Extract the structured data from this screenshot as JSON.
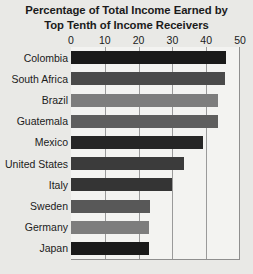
{
  "chart_data": {
    "type": "bar",
    "orientation": "horizontal",
    "title": "Percentage of Total Income Earned by Top Tenth of Income Receivers",
    "title_line1": "Percentage of Total Income Earned by",
    "title_line2": "Top Tenth of Income Receivers",
    "xlabel": "",
    "ylabel": "",
    "xlim": [
      0,
      50
    ],
    "xticks": [
      0,
      10,
      20,
      30,
      40,
      50
    ],
    "xtick_labels": [
      "0",
      "10",
      "20",
      "30",
      "40",
      "50"
    ],
    "grid": "vertical",
    "legend": "none",
    "categories": [
      "Colombia",
      "South Africa",
      "Brazil",
      "Guatemala",
      "Mexico",
      "United States",
      "Italy",
      "Sweden",
      "Germany",
      "Japan"
    ],
    "values": [
      46,
      45.5,
      43.5,
      43.5,
      39,
      33.5,
      30,
      23.5,
      23,
      23
    ],
    "bar_colors": [
      "#1a1a1a",
      "#4a4a4a",
      "#7d7d7d",
      "#5e5e5e",
      "#262626",
      "#3b3b3b",
      "#343434",
      "#585858",
      "#7d7d7d",
      "#1a1a1a"
    ],
    "series": [
      {
        "name": "Percentage of total income",
        "values": [
          46,
          45.5,
          43.5,
          43.5,
          39,
          33.5,
          30,
          23.5,
          23,
          23
        ]
      }
    ]
  },
  "style": {
    "background": "#e9e9e6",
    "plot_background": "#f3f3f1",
    "gridline_color": "#9a9a9a",
    "axis_color": "#8e8e8e",
    "text_color": "#1b1b1b"
  }
}
